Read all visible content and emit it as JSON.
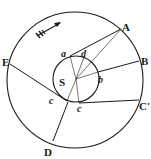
{
  "diagram": {
    "type": "orbital-geometry",
    "colors": {
      "ink": "#1a1a1a",
      "background": "#ffffff"
    },
    "outer_circle": {
      "cx": 75,
      "cy": 80,
      "r": 68
    },
    "inner_circle": {
      "cx": 76,
      "cy": 79,
      "r": 23
    },
    "center_label": "S",
    "outer_points": [
      {
        "id": "A",
        "label": "A",
        "x": 121,
        "y": 29,
        "lx": 123,
        "ly": 31
      },
      {
        "id": "B",
        "label": "B",
        "x": 139,
        "y": 61,
        "lx": 141,
        "ly": 65
      },
      {
        "id": "C",
        "label": "C'",
        "x": 139,
        "y": 100,
        "lx": 140,
        "ly": 110
      },
      {
        "id": "D",
        "label": "D",
        "x": 53,
        "y": 141,
        "lx": 44,
        "ly": 155
      },
      {
        "id": "E",
        "label": "E",
        "x": 10,
        "y": 64,
        "lx": 2,
        "ly": 66
      }
    ],
    "inner_points": [
      {
        "id": "a",
        "label": "a",
        "x": 70,
        "y": 56,
        "lx": 61,
        "ly": 57
      },
      {
        "id": "d",
        "label": "d",
        "x": 84,
        "y": 57,
        "lx": 80,
        "ly": 57
      },
      {
        "id": "b",
        "label": "b",
        "x": 98,
        "y": 73,
        "lx": 99,
        "ly": 83
      },
      {
        "id": "c1",
        "label": "c",
        "x": 79,
        "y": 103,
        "lx": 77,
        "ly": 112
      },
      {
        "id": "c2",
        "label": "c",
        "x": 67,
        "y": 101,
        "lx": 49,
        "ly": 104
      }
    ],
    "arrow": {
      "label": "direction-arrow",
      "x1": 37,
      "y1": 35,
      "x2": 60,
      "y2": 23
    }
  }
}
